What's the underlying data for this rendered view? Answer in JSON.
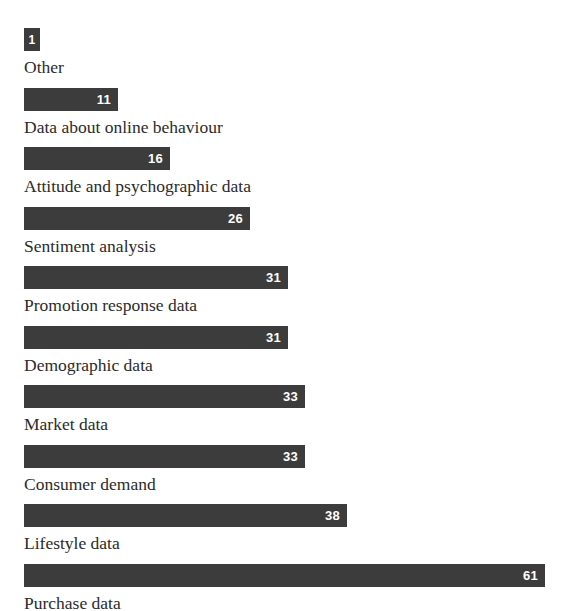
{
  "chart_data": {
    "type": "bar",
    "orientation": "horizontal",
    "title": "",
    "subtitle": "",
    "xlabel": "",
    "ylabel": "",
    "grid": false,
    "legend": null,
    "xlim": [
      0,
      61
    ],
    "categories": [
      "Other",
      "Data about online behaviour",
      "Attitude and psychographic data",
      "Sentiment analysis",
      "Promotion response data",
      "Demographic data",
      "Market data",
      "Consumer demand",
      "Lifestyle data",
      "Purchase data"
    ],
    "values": [
      1,
      11,
      16,
      26,
      31,
      31,
      33,
      33,
      38,
      61
    ],
    "value_labels": [
      "1",
      "11",
      "16",
      "26",
      "31",
      "31",
      "33",
      "33",
      "38",
      "61"
    ],
    "bar_color": "#3c3c3c",
    "value_label_color": "#ffffff",
    "background_color": "#ffffff",
    "text_color": "#2b2b2b"
  },
  "bars": [
    {
      "label": "Other",
      "value_label": "1",
      "width_px": 16
    },
    {
      "label": "Data about online behaviour",
      "value_label": "11",
      "width_px": 94
    },
    {
      "label": "Attitude and psychographic data",
      "value_label": "16",
      "width_px": 146
    },
    {
      "label": "Sentiment analysis",
      "value_label": "26",
      "width_px": 226
    },
    {
      "label": "Promotion response data",
      "value_label": "31",
      "width_px": 264
    },
    {
      "label": "Demographic data",
      "value_label": "31",
      "width_px": 264
    },
    {
      "label": "Market data",
      "value_label": "33",
      "width_px": 281
    },
    {
      "label": "Consumer demand",
      "value_label": "33",
      "width_px": 281
    },
    {
      "label": "Lifestyle data",
      "value_label": "38",
      "width_px": 323
    },
    {
      "label": "Purchase data",
      "value_label": "61",
      "width_px": 521
    }
  ]
}
